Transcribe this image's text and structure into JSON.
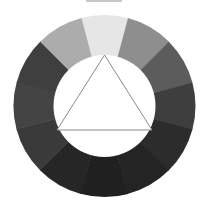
{
  "diagram": {
    "type": "color-wheel",
    "title_visible": "clipped",
    "center": [
      104.5,
      106
    ],
    "outer_radius": 91,
    "inner_radius": 51,
    "segments": [
      {
        "index": 1,
        "start_deg": -15,
        "color": "#e6e6e6"
      },
      {
        "index": 2,
        "start_deg": 15,
        "color": "#8e8e8e"
      },
      {
        "index": 3,
        "start_deg": 45,
        "color": "#5c5c5c"
      },
      {
        "index": 4,
        "start_deg": 75,
        "color": "#3e3e3e"
      },
      {
        "index": 5,
        "start_deg": 105,
        "color": "#2c2c2c"
      },
      {
        "index": 6,
        "start_deg": 135,
        "color": "#242424"
      },
      {
        "index": 7,
        "start_deg": 165,
        "color": "#202020"
      },
      {
        "index": 8,
        "start_deg": 195,
        "color": "#262626"
      },
      {
        "index": 9,
        "start_deg": 225,
        "color": "#3a3a3a"
      },
      {
        "index": 10,
        "start_deg": 255,
        "color": "#444444"
      },
      {
        "index": 11,
        "start_deg": 285,
        "color": "#3f3f3f"
      },
      {
        "index": 12,
        "start_deg": 315,
        "color": "#acacac"
      }
    ],
    "triangle": {
      "points": [
        [
          104.5,
          55
        ],
        [
          57,
          130
        ],
        [
          152,
          130
        ]
      ],
      "stroke": "#8a8a8a",
      "fill": "#ffffff"
    },
    "inner_fill": "#ffffff"
  }
}
